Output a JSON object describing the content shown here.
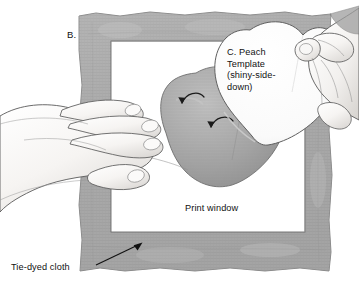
{
  "figure": {
    "panel_label": "B.",
    "title_hidden": "",
    "labels": {
      "template_caption": "C. Peach\nTemplate\n(shiny-side-\ndown)",
      "print_window": "Print window",
      "tie_dyed_cloth": "Tie-dyed cloth"
    },
    "icons": {
      "arrow_cloth": "leader-arrow-icon",
      "arrow_curl_upper": "curved-arrow-icon",
      "arrow_curl_lower": "curved-arrow-icon"
    },
    "colors": {
      "cloth_gray": "#a8a8a8",
      "cloth_gray_dark": "#8f8f8f",
      "peach_gray": "#a3a3a3",
      "peach_gray_dark": "#8a8a8a",
      "template_white": "#fbfbfb",
      "hand_fill": "#f4f2f0",
      "outline": "#4a4a4a",
      "background": "#ffffff"
    },
    "objects": [
      {
        "name": "tie-dyed-cloth",
        "description": "square of tie-dyed cloth with textured gray border"
      },
      {
        "name": "print-window",
        "description": "white rectangular opening in center of cloth"
      },
      {
        "name": "peach-shape",
        "description": "gray peach-shaped area on cloth"
      },
      {
        "name": "peach-template",
        "description": "white peach template held shiny-side-down"
      },
      {
        "name": "left-hand",
        "description": "hand holding cloth flat from the left"
      },
      {
        "name": "right-hand",
        "description": "hand lowering the template from upper right"
      }
    ]
  }
}
